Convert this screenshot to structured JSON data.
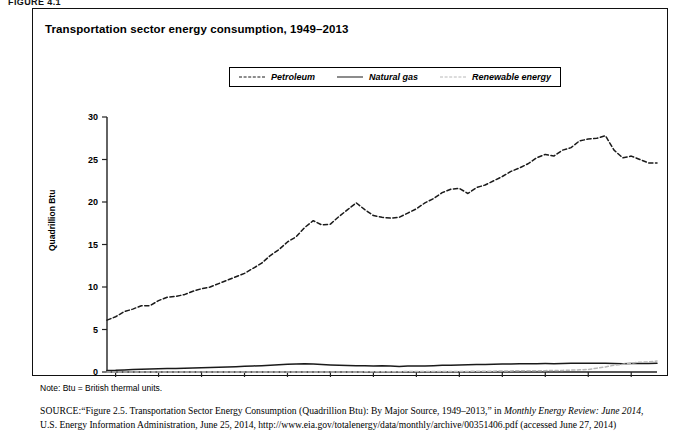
{
  "figure_label": "FIGURE 4.1",
  "chart_title": "Transportation sector energy consumption, 1949–2013",
  "note": "Note: Btu = British thermal units.",
  "source": {
    "prefix": "SOURCE:",
    "text_1": "“Figure 2.5. Transportation Sector Energy Consumption (Quadrillion Btu): By Major Source, 1949–2013,” in ",
    "italic_1": "Monthly Energy Review: June 2014",
    "text_2": ", U.S. Energy Information Administration, June 25, 2014, http://www.eia.gov/totalenergy/data/monthly/archive/00351406.pdf (accessed June 27, 2014)"
  },
  "legend": {
    "items": [
      {
        "label": "Petroleum",
        "style": "dashed",
        "color": "#1a1a1a"
      },
      {
        "label": "Natural gas",
        "style": "solid",
        "color": "#1a1a1a"
      },
      {
        "label": "Renewable energy",
        "style": "dotted",
        "color": "#b8b8b8"
      }
    ]
  },
  "chart_data": {
    "type": "line",
    "title": "Transportation sector energy consumption, 1949–2013",
    "xlabel": "",
    "ylabel": "Quadrillion Btu",
    "xlim": [
      1949,
      2013
    ],
    "ylim": [
      0,
      30
    ],
    "ytick_labels": [
      "0",
      "5",
      "10",
      "15",
      "20",
      "25",
      "30"
    ],
    "yticks": [
      0,
      5,
      10,
      15,
      20,
      25,
      30
    ],
    "xticks": [
      1950,
      1955,
      1960,
      1965,
      1970,
      1975,
      1980,
      1985,
      1990,
      1995,
      2000,
      2005,
      2010
    ],
    "grid": false,
    "legend_position": "top-center",
    "x": [
      1949,
      1950,
      1951,
      1952,
      1953,
      1954,
      1955,
      1956,
      1957,
      1958,
      1959,
      1960,
      1961,
      1962,
      1963,
      1964,
      1965,
      1966,
      1967,
      1968,
      1969,
      1970,
      1971,
      1972,
      1973,
      1974,
      1975,
      1976,
      1977,
      1978,
      1979,
      1980,
      1981,
      1982,
      1983,
      1984,
      1985,
      1986,
      1987,
      1988,
      1989,
      1990,
      1991,
      1992,
      1993,
      1994,
      1995,
      1996,
      1997,
      1998,
      1999,
      2000,
      2001,
      2002,
      2003,
      2004,
      2005,
      2006,
      2007,
      2008,
      2009,
      2010,
      2011,
      2012,
      2013
    ],
    "series": [
      {
        "name": "Petroleum",
        "style": "dashed",
        "color": "#1a1a1a",
        "values": [
          6.1,
          6.5,
          7.1,
          7.4,
          7.8,
          7.8,
          8.4,
          8.8,
          8.9,
          9.1,
          9.5,
          9.8,
          10.0,
          10.4,
          10.8,
          11.2,
          11.6,
          12.2,
          12.8,
          13.7,
          14.4,
          15.3,
          15.9,
          17.0,
          17.8,
          17.3,
          17.4,
          18.3,
          19.1,
          19.9,
          19.1,
          18.4,
          18.2,
          18.1,
          18.2,
          18.7,
          19.2,
          19.9,
          20.4,
          21.1,
          21.5,
          21.6,
          21.0,
          21.7,
          22.0,
          22.5,
          23.0,
          23.6,
          24.0,
          24.5,
          25.2,
          25.6,
          25.4,
          26.1,
          26.4,
          27.2,
          27.4,
          27.5,
          27.8,
          26.1,
          25.2,
          25.4,
          25.0,
          24.6,
          24.6
        ]
      },
      {
        "name": "Natural gas",
        "style": "solid",
        "color": "#1a1a1a",
        "values": [
          0.18,
          0.2,
          0.25,
          0.28,
          0.32,
          0.34,
          0.37,
          0.4,
          0.42,
          0.44,
          0.48,
          0.51,
          0.54,
          0.57,
          0.6,
          0.63,
          0.67,
          0.71,
          0.75,
          0.8,
          0.86,
          0.92,
          0.95,
          0.97,
          0.95,
          0.88,
          0.83,
          0.8,
          0.77,
          0.75,
          0.73,
          0.72,
          0.73,
          0.71,
          0.66,
          0.7,
          0.72,
          0.7,
          0.74,
          0.78,
          0.8,
          0.82,
          0.84,
          0.87,
          0.89,
          0.91,
          0.93,
          0.95,
          0.96,
          0.97,
          0.98,
          0.99,
          0.98,
          1.0,
          1.02,
          1.03,
          1.04,
          1.03,
          1.02,
          0.99,
          0.98,
          1.0,
          1.0,
          1.0,
          1.02
        ]
      },
      {
        "name": "Renewable energy",
        "style": "dotted",
        "color": "#b8b8b8",
        "values": [
          0.0,
          0.0,
          0.0,
          0.0,
          0.0,
          0.0,
          0.0,
          0.0,
          0.0,
          0.0,
          0.0,
          0.0,
          0.0,
          0.0,
          0.0,
          0.0,
          0.0,
          0.0,
          0.0,
          0.0,
          0.0,
          0.0,
          0.0,
          0.0,
          0.0,
          0.0,
          0.0,
          0.0,
          0.0,
          0.0,
          0.02,
          0.03,
          0.03,
          0.04,
          0.04,
          0.05,
          0.06,
          0.06,
          0.06,
          0.07,
          0.07,
          0.07,
          0.07,
          0.08,
          0.09,
          0.1,
          0.12,
          0.13,
          0.14,
          0.14,
          0.15,
          0.16,
          0.17,
          0.19,
          0.22,
          0.26,
          0.3,
          0.45,
          0.6,
          0.8,
          0.9,
          1.05,
          1.15,
          1.18,
          1.3
        ]
      }
    ]
  }
}
